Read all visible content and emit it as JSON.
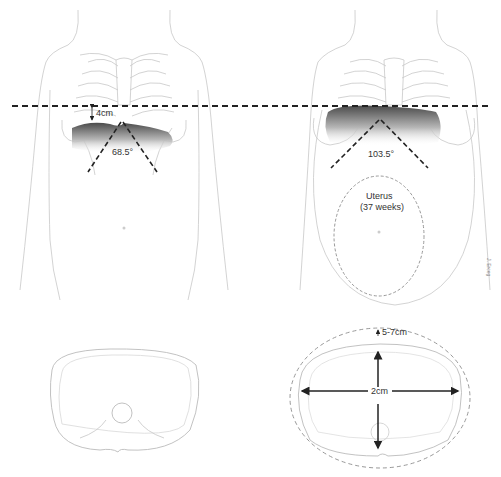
{
  "figure": {
    "left_panel": {
      "description": "Non-pregnant torso, anterior view",
      "distance_label": "4cm",
      "subcostal_angle_label": "68.5°"
    },
    "right_panel": {
      "description": "Pregnant torso (term), anterior view",
      "subcostal_angle_label": "103.5°",
      "uterus_label_line1": "Uterus",
      "uterus_label_line2": "(37 weeks)",
      "signature": "J. Erceg"
    },
    "bottom_left": {
      "description": "Axial thoracic cross-section, non-pregnant"
    },
    "bottom_right": {
      "description": "Axial thoracic cross-section, pregnant with expansion",
      "circumference_label": "5-7cm",
      "transverse_label": "2cm"
    },
    "colors": {
      "outline": "#c8c8c8",
      "dashed_line": "#222222",
      "diaphragm_dark": "#555555",
      "uterus_dash": "#999999"
    }
  }
}
